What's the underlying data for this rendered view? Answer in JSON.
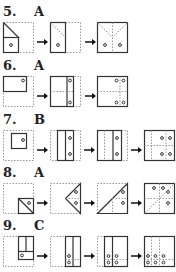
{
  "problems": [
    {
      "number": "5.",
      "answer": "A",
      "steps": 3
    },
    {
      "number": "6.",
      "answer": "A",
      "steps": 3
    },
    {
      "number": "7.",
      "answer": "B",
      "steps": 4
    },
    {
      "number": "8.",
      "answer": "A",
      "steps": 4
    },
    {
      "number": "9.",
      "answer": "C",
      "steps": 4
    }
  ],
  "icons": {
    "arrow": "right-arrow-icon",
    "hole": "punched-hole-circle"
  },
  "colors": {
    "stroke": "#333333",
    "dashed": "#999999",
    "background": "#ffffff"
  }
}
